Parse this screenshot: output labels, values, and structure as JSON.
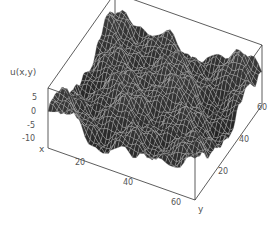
{
  "chart_data": {
    "type": "surface3d",
    "zlabel": "u(x,y)",
    "xlabel": "x",
    "ylabel": "y",
    "x_ticks": [
      "20",
      "40",
      "60"
    ],
    "y_ticks": [
      "20",
      "40",
      "60"
    ],
    "z_ticks": [
      "5",
      "0",
      "-5",
      "-10"
    ],
    "x_range": [
      0,
      64
    ],
    "y_range": [
      0,
      64
    ],
    "z_range": [
      -12,
      8
    ],
    "grid_size": 64,
    "mesh_color": "#111111",
    "face_color": "#2a2a2a",
    "box_color": "#333333"
  }
}
